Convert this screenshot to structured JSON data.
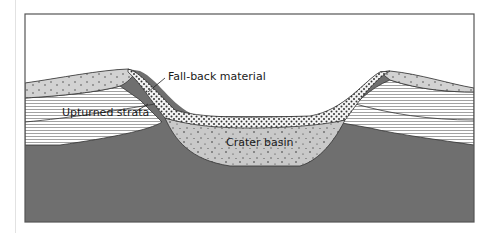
{
  "diagram": {
    "type": "cross-section",
    "labels": {
      "fallback": "Fall-back material",
      "strata": "Upturned strata",
      "basin": "Crater basin"
    },
    "colors": {
      "frame": "#555555",
      "bedrock": "#6f6f6f",
      "basin_fill": "#c9c9c9",
      "ejecta_fill": "#cfcfcf",
      "fallback_fill": "#f4f4f4",
      "strata_line": "#8a8a8a",
      "outline": "#333333"
    }
  }
}
